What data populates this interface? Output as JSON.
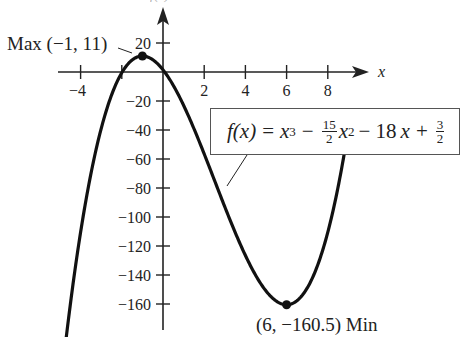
{
  "chart_data": {
    "type": "line",
    "title": "",
    "function": "f(x) = x^3 - (15/2)x^2 - 18x + 3/2",
    "xlabel": "x",
    "ylabel": "f(x)",
    "xlim": [
      -4.7,
      9
    ],
    "ylim": [
      -180,
      20
    ],
    "x_ticks": [
      -4,
      -2,
      2,
      4,
      6,
      8
    ],
    "x_tick_labels": [
      "−4",
      "2",
      "4",
      "6",
      "8"
    ],
    "y_ticks": [
      20,
      -20,
      -40,
      -60,
      -80,
      -100,
      -120,
      -140,
      -160
    ],
    "y_tick_labels": [
      "20",
      "−20",
      "−40",
      "−60",
      "−80",
      "−100",
      "−120",
      "−140",
      "−160"
    ],
    "coefficients": {
      "a": 1,
      "b": -7.5,
      "c": -18,
      "d": 1.5
    },
    "domain_plotted": [
      -4.73,
      8.8
    ],
    "points": [
      {
        "x": -1,
        "y": 11,
        "label": "Max (−1, 11)",
        "kind": "max"
      },
      {
        "x": 6,
        "y": -160.5,
        "label": "(6, −160.5) Min",
        "kind": "min"
      }
    ],
    "grid": false,
    "legend": "none"
  },
  "annotations": {
    "max_label": "Max (−1, 11)",
    "min_label": "(6, −160.5) Min",
    "x_axis_label": "x",
    "y_axis_label": "f(x)"
  },
  "formula": {
    "lhs": "f(x)",
    "eq": "=",
    "t1": "x",
    "t1_exp": "3",
    "minus1": "−",
    "frac1_num": "15",
    "frac1_den": "2",
    "t2": "x",
    "t2_exp": "2",
    "minus2": "− 18",
    "t3": "x",
    "plus": "+",
    "frac2_num": "3",
    "frac2_den": "2"
  }
}
